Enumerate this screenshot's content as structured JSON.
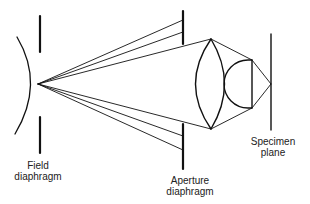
{
  "diagram": {
    "type": "optical-ray-diagram",
    "colors": {
      "line": "#111111",
      "text": "#222222",
      "background": "#ffffff"
    },
    "labels": {
      "field_diaphragm": {
        "line1": "Field",
        "line2": "diaphragm"
      },
      "aperture_diaphragm": {
        "line1": "Aperture",
        "line2": "diaphragm"
      },
      "specimen_plane": {
        "line1": "Specimen",
        "line2": "plane"
      }
    },
    "components": [
      "curved-source-surface",
      "field-diaphragm",
      "aperture-diaphragm",
      "biconvex-condenser-lens",
      "hemispherical-front-lens",
      "specimen-plane"
    ]
  }
}
